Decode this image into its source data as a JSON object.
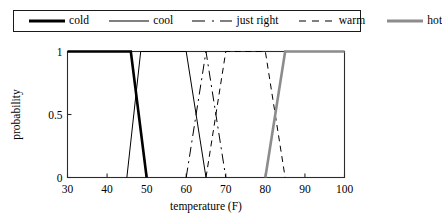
{
  "legend": {
    "entries": [
      {
        "label": "cold",
        "style": "solid-thick",
        "color": "#000000"
      },
      {
        "label": "cool",
        "style": "solid-thin",
        "color": "#000000"
      },
      {
        "label": "just right",
        "style": "dash-dot",
        "color": "#000000"
      },
      {
        "label": "warm",
        "style": "dashed",
        "color": "#000000"
      },
      {
        "label": "hot",
        "style": "solid-thick-gray",
        "color": "#8c8c8c"
      }
    ]
  },
  "chart_data": {
    "type": "line",
    "title": "",
    "xlabel": "temperature (F)",
    "ylabel": "probability",
    "xlim": [
      30,
      100
    ],
    "ylim": [
      0,
      1
    ],
    "xticks": [
      30,
      40,
      50,
      60,
      70,
      80,
      90,
      100
    ],
    "xtick_labels": [
      "30",
      "40",
      "50",
      "60",
      "70",
      "80",
      "90",
      "100"
    ],
    "yticks": [
      0,
      0.5,
      1
    ],
    "ytick_labels": [
      "0",
      "0.5",
      "1"
    ],
    "grid": false,
    "legend_position": "above-plot",
    "series": [
      {
        "name": "cold",
        "color": "#000000",
        "linestyle": "solid",
        "linewidth": 2.6,
        "x": [
          30,
          46,
          50
        ],
        "y": [
          1,
          1,
          0
        ]
      },
      {
        "name": "cool",
        "color": "#000000",
        "linestyle": "solid",
        "linewidth": 1.0,
        "x": [
          45,
          48.5,
          60,
          65
        ],
        "y": [
          0,
          1,
          1,
          0
        ]
      },
      {
        "name": "just right",
        "color": "#000000",
        "linestyle": "dashdot",
        "linewidth": 1.0,
        "x": [
          60,
          65,
          70
        ],
        "y": [
          0,
          1,
          0
        ]
      },
      {
        "name": "warm",
        "color": "#000000",
        "linestyle": "dashed",
        "linewidth": 1.0,
        "x": [
          65,
          70,
          80,
          85
        ],
        "y": [
          0,
          1,
          1,
          0
        ]
      },
      {
        "name": "hot",
        "color": "#8c8c8c",
        "linestyle": "solid",
        "linewidth": 2.6,
        "x": [
          80,
          85,
          100
        ],
        "y": [
          0,
          1,
          1
        ]
      }
    ]
  }
}
